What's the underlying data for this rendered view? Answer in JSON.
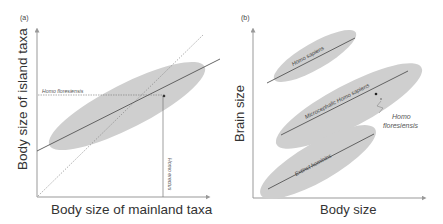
{
  "figure": {
    "panel_a": {
      "label": "(a)",
      "x_axis_title": "Body size of mainland taxa",
      "y_axis_title": "Body size of island taxa",
      "horizontal_marker_label": "Homo floresiensis",
      "vertical_marker_label": "Homo erectus",
      "elements": [
        "shaded ellipse of island vs mainland body size",
        "solid regression line",
        "dotted 1:1 line",
        "dashed guide to Homo floresiensis point"
      ]
    },
    "panel_b": {
      "label": "(b)",
      "x_axis_title": "Body size",
      "y_axis_title": "Brain size",
      "groups": [
        {
          "name": "Homo sapiens"
        },
        {
          "name": "Microcephalic Homo sapiens"
        },
        {
          "name": "Extinct hominins"
        }
      ],
      "annotation_line1": "Homo",
      "annotation_line2": "floresiensis"
    }
  },
  "colors": {
    "ellipse_fill": "#cfcfcf",
    "line": "#555555",
    "axis": "#999999",
    "text": "#333333"
  }
}
